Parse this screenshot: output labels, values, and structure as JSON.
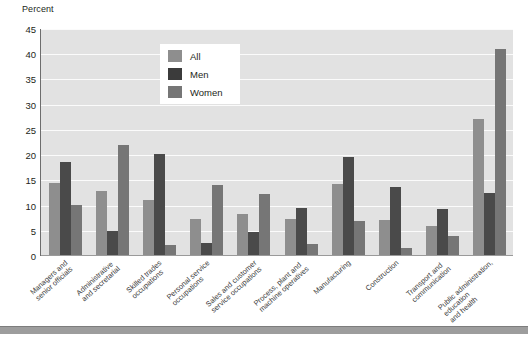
{
  "chart_data": {
    "type": "bar",
    "title": "",
    "subtitle": "",
    "ylabel": "Percent",
    "xlabel": "",
    "ylim": [
      0,
      45
    ],
    "yticks": [
      45,
      40,
      35,
      30,
      25,
      20,
      15,
      10,
      5,
      0
    ],
    "grid": true,
    "legend_position": "top-center",
    "categories": [
      "Managers and senior officials",
      "Administrative and secretarial",
      "Skilled trades occupations",
      "Personal service occupations",
      "Sales and customer service occupations",
      "Process, plant and machine operatives",
      "Manufacturing",
      "Construction",
      "Transport and communication",
      "Public administration, education and health"
    ],
    "category_lines": [
      [
        "Managers and",
        "senior officials"
      ],
      [
        "Administrative",
        "and secretarial"
      ],
      [
        "Skilled trades",
        "occupations"
      ],
      [
        "Personal service",
        "occupations"
      ],
      [
        "Sales and customer",
        "service occupations"
      ],
      [
        "Process, plant and",
        "machine operatives"
      ],
      [
        "Manufacturing"
      ],
      [
        "Construction"
      ],
      [
        "Transport and",
        "communication"
      ],
      [
        "Public administration,",
        "education",
        "and health"
      ]
    ],
    "series": [
      {
        "name": "All",
        "color": "#8e8e8e",
        "values": [
          14.3,
          12.6,
          11.0,
          7.1,
          8.2,
          7.2,
          14.0,
          7.0,
          5.7,
          27.0
        ]
      },
      {
        "name": "Men",
        "color": "#4a4a4a",
        "values": [
          18.5,
          4.7,
          20.0,
          2.4,
          4.5,
          9.4,
          19.4,
          13.4,
          9.2,
          12.3
        ]
      },
      {
        "name": "Women",
        "color": "#767676",
        "values": [
          10.0,
          21.9,
          1.9,
          13.9,
          12.0,
          2.1,
          6.8,
          1.4,
          3.8,
          40.8
        ]
      }
    ]
  },
  "legend": {
    "items": [
      {
        "label": "All",
        "swatch": "legend-swatch-all"
      },
      {
        "label": "Men",
        "swatch": "legend-swatch-men"
      },
      {
        "label": "Women",
        "swatch": "legend-swatch-women"
      }
    ]
  },
  "colors": {
    "plot_background": "#e2e2e2",
    "gridline": "#fbfbfb",
    "all": "#8e8e8e",
    "men": "#4a4a4a",
    "women": "#767676",
    "text": "#231f20"
  }
}
